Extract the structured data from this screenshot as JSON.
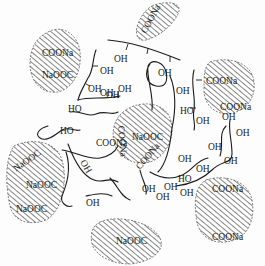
{
  "figure": {
    "colors": {
      "ink": "#1a1a1a",
      "background": "#fdfdfd",
      "hatch": "#444444"
    }
  },
  "groups": {
    "carboxylate": "COONa",
    "carboxylate_rev": "NaOOC",
    "hydroxyl": "OH",
    "hydroxyl_rev": "HO"
  },
  "particles": [
    {
      "id": "top-center",
      "labels": [
        "COONa"
      ]
    },
    {
      "id": "top-left",
      "labels": [
        "COONa",
        "NaOOC"
      ]
    },
    {
      "id": "right-upper",
      "labels": [
        "COONa",
        "COONa"
      ]
    },
    {
      "id": "center",
      "labels": [
        "COONa",
        "NaOOC",
        "COONa",
        "COONa"
      ]
    },
    {
      "id": "left",
      "labels": [
        "NaOOC",
        "NaOOC",
        "NaOOC"
      ]
    },
    {
      "id": "bottom-center",
      "labels": [
        "NaOOC"
      ]
    },
    {
      "id": "bottom-right",
      "labels": [
        "COONa",
        "COONa"
      ]
    }
  ],
  "labels": {
    "l1": "COONa",
    "l2": "COONa",
    "l3": "NaOOC",
    "l4": "COONa",
    "l5": "COONa",
    "l6": "COONa",
    "l7": "NaOOC",
    "l8": "COONa",
    "l9": "COONa",
    "l10": "NaOOC",
    "l11": "NaOOC",
    "l12": "NaOOC",
    "l13": "NaOOC",
    "l14": "COONa",
    "l15": "COONa",
    "h1": "OH",
    "h2": "OH",
    "h3": "OH",
    "h4": "OH",
    "h5": "OH",
    "h6": "OH",
    "h7": "OH",
    "h8": "HO",
    "h9": "OH",
    "h10": "HO",
    "h11": "HO",
    "h12": "HO",
    "h13": "OH",
    "h14": "OH",
    "h15": "OH",
    "h16": "OH",
    "h17": "OH",
    "h18": "OH",
    "h19": "OH",
    "h20": "OH",
    "h21": "OH",
    "h22": "OH",
    "h23": "OH",
    "h24": "OH",
    "h25": "OH"
  }
}
